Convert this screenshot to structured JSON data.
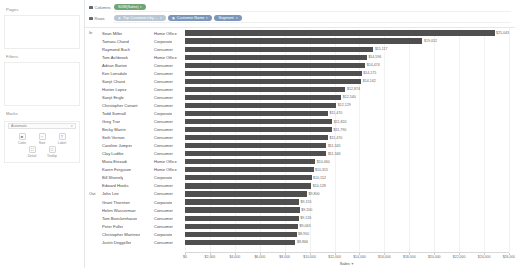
{
  "left_panel": {
    "pages": {
      "title": "Pages"
    },
    "filters": {
      "title": "Filters"
    },
    "marks": {
      "title": "Marks",
      "type_selector": {
        "value": "Automatic",
        "caret": "chevron-down-icon"
      },
      "buttons": [
        {
          "label": "Color",
          "glyph": "■",
          "name": "color"
        },
        {
          "label": "Size",
          "glyph": "⇔",
          "name": "size"
        },
        {
          "label": "Label",
          "glyph": "T",
          "name": "label"
        },
        {
          "label": "Detail",
          "glyph": "∷",
          "name": "detail"
        },
        {
          "label": "Tooltip",
          "glyph": "□",
          "name": "tooltip"
        }
      ]
    }
  },
  "shelves": {
    "columns": {
      "label": "Columns",
      "icon": "grid-icon",
      "pills": [
        {
          "text": "SUM(Sales)",
          "color": "green",
          "caret": "▾"
        }
      ]
    },
    "rows": {
      "label": "Rows",
      "icon": "grid-icon",
      "pills": [
        {
          "text": "Top Customers by ...",
          "color": "blue",
          "caret": "▾",
          "icon": "set-icon"
        },
        {
          "text": "Customer Name",
          "color": "blue",
          "caret": "▾",
          "icon": "dim-icon"
        },
        {
          "text": "Segment",
          "color": "blue",
          "caret": "▾",
          "icon": "dim-icon"
        }
      ]
    }
  },
  "chart_data": {
    "type": "bar",
    "title": "",
    "xlabel": "Sales",
    "ylabel": "",
    "orientation": "horizontal",
    "xlim": [
      0,
      26000
    ],
    "grid": true,
    "bar_color": "#4f4f4f",
    "legend": "none",
    "tick_values": [
      0,
      2000,
      4000,
      6000,
      8000,
      10000,
      12000,
      14000,
      16000,
      18000,
      20000,
      22000,
      24000,
      26000
    ],
    "tick_labels": [
      "$0",
      "$2,000",
      "$4,000",
      "$6,000",
      "$8,000",
      "$10,000",
      "$12,000",
      "$14,000",
      "$16,000",
      "$18,000",
      "$20,000",
      "$22,000",
      "$24,000",
      "$26,000"
    ],
    "groups": [
      {
        "label": "In",
        "start_index": 0,
        "count": 20
      },
      {
        "label": "Out",
        "start_index": 20,
        "count": 8
      }
    ],
    "categories": [
      "Sean Miller",
      "Tamara Chand",
      "Raymond Buch",
      "Tom Ashbrook",
      "Adrian Barton",
      "Ken Lonsdale",
      "Sanjit Chand",
      "Hunter Lopez",
      "Sanjit Engle",
      "Christopher Conant",
      "Todd Sumrall",
      "Greg Tran",
      "Becky Martin",
      "Seth Vernon",
      "Caroline Jumper",
      "Clay Ludtke",
      "Maria Etezadi",
      "Karen Ferguson",
      "Bill Shonely",
      "Edward Hooks",
      "John Lee",
      "Grant Thornton",
      "Helen Wasserman",
      "Tom Boeckenhauer",
      "Peter Fuller",
      "Christopher Martinez",
      "Justin Deggeller"
    ],
    "segments": [
      "Home Office",
      "Corporate",
      "Consumer",
      "Home Office",
      "Consumer",
      "Consumer",
      "Consumer",
      "Consumer",
      "Consumer",
      "Consumer",
      "Corporate",
      "Consumer",
      "Consumer",
      "Consumer",
      "Consumer",
      "Consumer",
      "Home Office",
      "Home Office",
      "Corporate",
      "Consumer",
      "Consumer",
      "Corporate",
      "Consumer",
      "Consumer",
      "Consumer",
      "Corporate",
      "Consumer"
    ],
    "values": [
      25043,
      19052,
      15117,
      14596,
      14474,
      14175,
      14142,
      12874,
      12540,
      12129,
      11470,
      11820,
      11790,
      11470,
      11345,
      11346,
      10460,
      10315,
      10152,
      10128,
      9800,
      9155,
      9200,
      9126,
      9063,
      8950,
      8866
    ],
    "value_labels": [
      "$25,043",
      "$19,052",
      "$15,117",
      "$14,596",
      "$14,474",
      "$14,175",
      "$14,142",
      "$12,874",
      "$12,540",
      "$12,129",
      "$11,470",
      "$11,820",
      "$11,790",
      "$11,470",
      "$11,345",
      "$11,346",
      "$10,460",
      "$10,315",
      "$10,152",
      "$10,128",
      "$9,800",
      "$9,155",
      "$9,200",
      "$9,126",
      "$9,063",
      "$8,950",
      "$8,866"
    ]
  }
}
